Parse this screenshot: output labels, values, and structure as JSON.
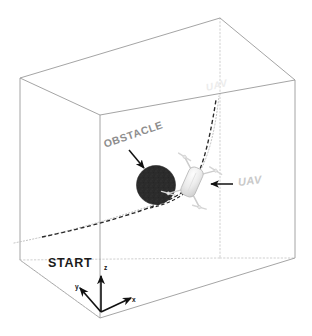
{
  "figure": {
    "kind": "3d-uav-trajectory-diagram",
    "background_color": "#ffffff"
  },
  "labels": {
    "obstacle": "OBSTACLE",
    "uav": "UAV",
    "uav_top": "UAV",
    "start": "START"
  },
  "axes": {
    "z": "z",
    "x": "x",
    "y": "y"
  },
  "colors": {
    "box_edge": "#9a9a9a",
    "box_hidden_edge": "#c9c9c9",
    "obstacle": "#2b2b2b",
    "uav_body": "#e2e2e2",
    "uav_outline": "#b8b8b8",
    "trajectory": "#2a2a2a",
    "trajectory_ghost": "#b0b0b0",
    "arrow": "#111111",
    "axis": "#111111",
    "label_obstacle": "#8d8d8d",
    "label_uav": "#c9c9c9",
    "label_start": "#1b1b1b"
  },
  "scene_elements": {
    "bounding_box": "wireframe-cuboid",
    "obstacle_shape": "filled-circle",
    "obstacle_center": [
      156,
      185
    ],
    "obstacle_radius": 19,
    "uav_shape": "quadrotor",
    "trajectory_style": "dashed-curve",
    "goal_point": [
      220,
      93
    ],
    "start_point": [
      42,
      237
    ]
  }
}
